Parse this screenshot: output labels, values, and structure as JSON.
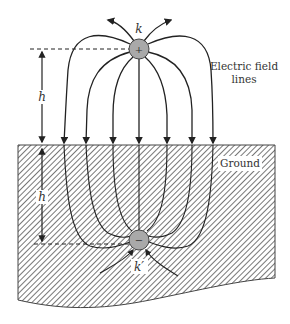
{
  "diagram": {
    "labels": {
      "positive_charge": "k",
      "image_charge": "k′",
      "positive_sign": "+",
      "negative_sign": "−",
      "height_above": "h",
      "depth_below": "h",
      "field_lines_line1": "Electric field",
      "field_lines_line2": "lines",
      "ground": "Ground"
    },
    "colors": {
      "line": "#222222",
      "charge_fill": "#a9a9a9",
      "hatch": "#555555",
      "background": "#ffffff"
    }
  }
}
